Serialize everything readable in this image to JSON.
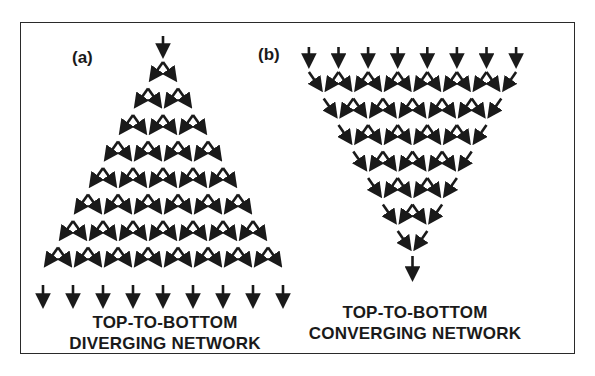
{
  "figure": {
    "panels": [
      {
        "id": "a",
        "label": "(a)",
        "caption_line1": "TOP-TO-BOTTOM",
        "caption_line2": "DIVERGING NETWORK",
        "type": "diverging",
        "input_arrows": 1,
        "caret_rows": 8,
        "output_arrows": 9
      },
      {
        "id": "b",
        "label": "(b)",
        "caption_line1": "TOP-TO-BOTTOM",
        "caption_line2": "CONVERGING NETWORK",
        "type": "converging",
        "input_arrows": 8,
        "merge_rows": 7,
        "output_arrows": 1
      }
    ],
    "colors": {
      "ink": "#1a1a1a",
      "frame": "#2a2a2a",
      "background": "#ffffff"
    }
  }
}
